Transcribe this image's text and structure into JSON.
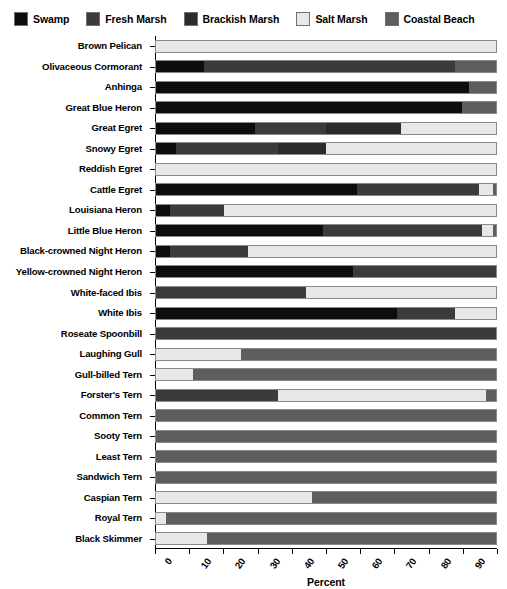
{
  "chart_data": {
    "type": "bar",
    "subtype": "stacked-horizontal-bar-100pct",
    "title": "",
    "xlabel": "Percent",
    "ylabel": "",
    "xlim": [
      0,
      100
    ],
    "xticks": [
      0,
      10,
      20,
      30,
      40,
      50,
      60,
      70,
      80,
      90,
      100
    ],
    "xtick_labels": [
      "0",
      "10",
      "20",
      "30",
      "40",
      "50",
      "60",
      "70",
      "80",
      "90",
      "100"
    ],
    "grid": false,
    "legend_position": "top",
    "legend": [
      "Swamp",
      "Fresh Marsh",
      "Brackish Marsh",
      "Salt Marsh",
      "Coastal Beach"
    ],
    "series_colors": [
      "#0d0d0d",
      "#3b3b3b",
      "#2b2b2b",
      "#e8e8e8",
      "#5e5e5e"
    ],
    "categories": [
      "Brown Pelican",
      "Olivaceous Cormorant",
      "Anhinga",
      "Great Blue Heron",
      "Great Egret",
      "Snowy Egret",
      "Reddish Egret",
      "Cattle Egret",
      "Louisiana Heron",
      "Little Blue Heron",
      "Black-crowned Night Heron",
      "Yellow-crowned Night Heron",
      "White-faced Ibis",
      "White Ibis",
      "Roseate Spoonbill",
      "Laughing Gull",
      "Gull-billed Tern",
      "Forster's Tern",
      "Common Tern",
      "Sooty Tern",
      "Least Tern",
      "Sandwich Tern",
      "Caspian Tern",
      "Royal Tern",
      "Black Skimmer"
    ],
    "series": [
      {
        "name": "Swamp",
        "color": "#0d0d0d",
        "values": [
          0,
          14,
          92,
          90,
          29,
          6,
          0,
          59,
          4,
          49,
          4,
          58,
          0,
          71,
          0,
          0,
          0,
          0,
          0,
          0,
          0,
          0,
          0,
          0,
          0
        ]
      },
      {
        "name": "Fresh Marsh",
        "color": "#3b3b3b",
        "values": [
          0,
          74,
          0,
          0,
          21,
          30,
          0,
          36,
          16,
          47,
          23,
          42,
          44,
          17,
          100,
          0,
          0,
          36,
          0,
          0,
          0,
          0,
          0,
          0,
          0
        ]
      },
      {
        "name": "Brackish Marsh",
        "color": "#2b2b2b",
        "values": [
          0,
          0,
          0,
          0,
          22,
          14,
          0,
          0,
          0,
          0,
          0,
          0,
          0,
          0,
          0,
          0,
          0,
          0,
          0,
          0,
          0,
          0,
          0,
          0,
          0
        ]
      },
      {
        "name": "Salt Marsh",
        "color": "#e8e8e8",
        "values": [
          100,
          0,
          0,
          0,
          28,
          50,
          100,
          4,
          80,
          3,
          73,
          0,
          56,
          12,
          0,
          25,
          11,
          61,
          0,
          0,
          0,
          0,
          46,
          3,
          15
        ]
      },
      {
        "name": "Coastal Beach",
        "color": "#5e5e5e",
        "values": [
          0,
          12,
          8,
          10,
          0,
          0,
          0,
          1,
          0,
          1,
          0,
          0,
          0,
          0,
          0,
          75,
          89,
          3,
          100,
          100,
          100,
          100,
          54,
          97,
          85
        ]
      }
    ]
  },
  "legend": {
    "items": [
      {
        "label": "Swamp",
        "color": "#0d0d0d"
      },
      {
        "label": "Fresh Marsh",
        "color": "#3b3b3b"
      },
      {
        "label": "Brackish Marsh",
        "color": "#2b2b2b"
      },
      {
        "label": "Salt Marsh",
        "color": "#e8e8e8"
      },
      {
        "label": "Coastal Beach",
        "color": "#5e5e5e"
      }
    ]
  },
  "axis": {
    "x_title": "Percent"
  }
}
